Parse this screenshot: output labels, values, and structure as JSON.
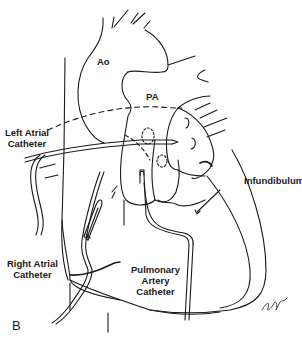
{
  "figure": {
    "panel_label": "B",
    "labels": {
      "aorta": "Ao",
      "pulmonary_artery": "PA",
      "left_atrial_catheter_line1": "Left Atrial",
      "left_atrial_catheter_line2": "Catheter",
      "infundibulum": "Infundibulum",
      "right_atrial_catheter_line1": "Right Atrial",
      "right_atrial_catheter_line2": "Catheter",
      "pulmonary_artery_catheter_line1": "Pulmonary",
      "pulmonary_artery_catheter_line2": "Artery",
      "pulmonary_artery_catheter_line3": "Catheter"
    },
    "colors": {
      "ink": "#1a1a1a",
      "background": "#ffffff"
    }
  }
}
